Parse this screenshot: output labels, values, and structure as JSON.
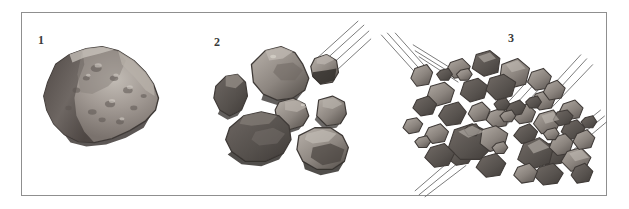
{
  "figure": {
    "border_color": "#8f8f8f",
    "background_color": "#ffffff",
    "panel_count": 3
  },
  "palette": {
    "rock_outline": "#4a4442",
    "rock_dark": "#595350",
    "rock_mid": "#7d7571",
    "rock_light": "#a9a29c",
    "rock_highlight": "#c2bcb5",
    "shadow": "#3f3a37",
    "trajectory_line": "#6b6b6b",
    "label_color": "#3a3a3a"
  },
  "panels": [
    {
      "id": "panel-1",
      "label": "1",
      "caption_text": "1",
      "stage_name": "intact-asteroid",
      "fragment_count": 1,
      "trajectory_line_groups": 0
    },
    {
      "id": "panel-2",
      "label": "2",
      "caption_text": "2",
      "stage_name": "partially-fragmented-asteroid",
      "fragment_count": 7,
      "trajectory_line_groups": 1
    },
    {
      "id": "panel-3",
      "label": "3",
      "caption_text": "3",
      "stage_name": "fully-fragmented-asteroid-swarm",
      "fragment_count": 46,
      "trajectory_line_groups": 6
    }
  ]
}
